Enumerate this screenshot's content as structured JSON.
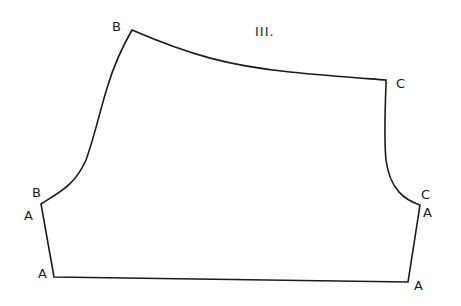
{
  "figure": {
    "title": "III.",
    "shape": "sewing pattern piece (sleeve/bodice outline)",
    "stroke_color": "#1a1a1a",
    "background": "#ffffff"
  },
  "labels": {
    "top_left": "B",
    "top_right": "C",
    "mid_left_upper": "B",
    "mid_left_lower": "A",
    "mid_right_upper": "C",
    "mid_right_lower": "A",
    "bottom_left": "A",
    "bottom_right": "A"
  },
  "vertices": {
    "B_top": [
      132,
      30
    ],
    "C_top": [
      386,
      80
    ],
    "CA_right": [
      420,
      205
    ],
    "A_bottom_right": [
      408,
      282
    ],
    "A_bottom_left": [
      54,
      277
    ],
    "BA_left": [
      41,
      204
    ]
  }
}
